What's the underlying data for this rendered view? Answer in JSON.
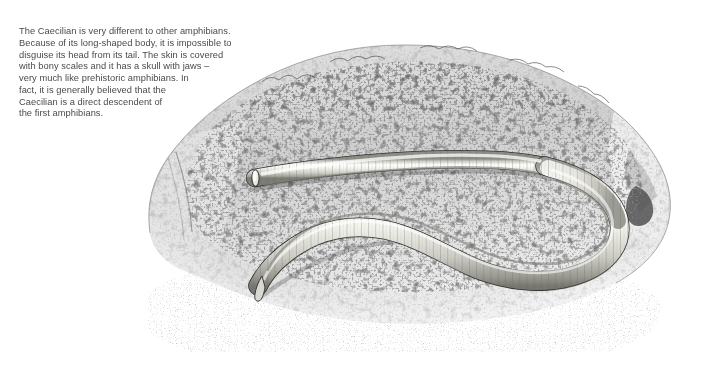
{
  "figure": {
    "subject": "caecilian",
    "habitat": "rock",
    "caption_text": "The Caecilian is very different to other amphibians.\nBecause of its long-shaped body, it is impossible to\ndisguise its head from its tail. The skin is covered\nwith bony scales and it has a skull with jaws –\nvery much like prehistoric amphibians. In\nfact, it is generally believed that the\nCaecilian is a direct descendent of\nthe first amphibians.",
    "illustration_name": "caecilian-on-rock-illustration",
    "medium": "pen-and-ink stipple drawing",
    "colors": {
      "text": "#4a4a4a",
      "background": "#ffffff",
      "rock_light": "#d9d9d9",
      "rock_mid": "#9a9a9a",
      "rock_dark": "#3a3a3a",
      "body_light": "#ffffff",
      "body_mid": "#dcdcd6",
      "body_shadow": "#8e8e88",
      "outline": "#2b2b2b"
    }
  }
}
